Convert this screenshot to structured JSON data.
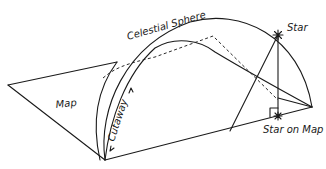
{
  "diagram": {
    "labels": {
      "celestial_sphere": "Celestial Sphere",
      "star": "Star",
      "map": "Map",
      "cutaway": "Cutaway",
      "star_on_map": "Star on Map"
    },
    "colors": {
      "ink": "#1a1a1a",
      "background": "#ffffff"
    }
  }
}
